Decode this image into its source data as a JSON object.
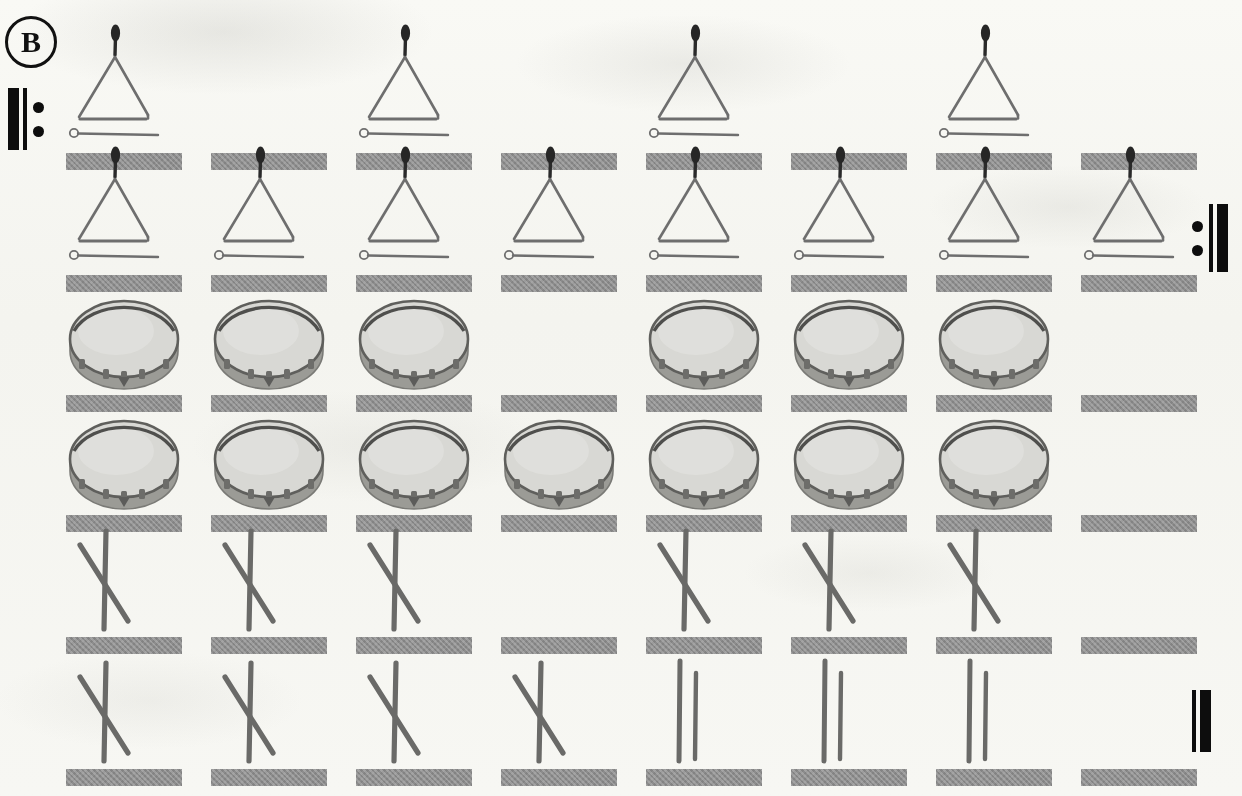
{
  "panel": {
    "label": "B",
    "title": "Percussion rhythm grid"
  },
  "notation": {
    "repeat_start": {
      "name": "repeat-start-sign",
      "glyph": "|:",
      "dots": 2
    },
    "repeat_end": {
      "name": "repeat-end-sign",
      "glyph": ":|",
      "dots": 2
    },
    "final_barline": {
      "name": "final-barline",
      "glyph": "||",
      "dots": 0
    }
  },
  "colors": {
    "beat_bar": "#8d8d8d",
    "ink": "#0d0d0d",
    "paper": "#fbfbf9",
    "instrument_outline": "#6e6e6e",
    "drum_head": "#d8d8d4",
    "drum_rim": "#7a7a76",
    "clave": "#6a6a68"
  },
  "grid": {
    "columns": 8,
    "rows": 6,
    "column_x": [
      66,
      211,
      356,
      501,
      646,
      791,
      936,
      1081
    ],
    "cell_width": 116,
    "row_top": [
      22,
      180,
      300,
      420,
      540,
      662
    ],
    "row_height": [
      148,
      112,
      112,
      112,
      114,
      124
    ],
    "bar_height": 17
  },
  "instruments": {
    "triangle": {
      "name": "triangle",
      "label": "Triangle with beater"
    },
    "drum": {
      "name": "hand-drum",
      "label": "Frame drum"
    },
    "claves_crossed": {
      "name": "claves-crossed",
      "label": "Crossed claves"
    },
    "claves_parallel": {
      "name": "claves-parallel",
      "label": "Parallel claves"
    },
    "rest": {
      "name": "rest",
      "label": "Silent beat"
    }
  },
  "chart_data": {
    "type": "table",
    "xlabel": "Beat",
    "ylabel": "Measure",
    "categories": [
      "1",
      "2",
      "3",
      "4",
      "5",
      "6",
      "7",
      "8"
    ],
    "legend": [
      "triangle",
      "drum",
      "claves_crossed",
      "claves_parallel",
      "rest"
    ],
    "rows": [
      {
        "row": 1,
        "instrument": "triangle",
        "cells": [
          "triangle",
          "rest",
          "triangle",
          "rest",
          "triangle",
          "rest",
          "triangle",
          "rest"
        ],
        "values": [
          1,
          0,
          1,
          0,
          1,
          0,
          1,
          0
        ]
      },
      {
        "row": 2,
        "instrument": "triangle",
        "cells": [
          "triangle",
          "triangle",
          "triangle",
          "triangle",
          "triangle",
          "triangle",
          "triangle",
          "triangle"
        ],
        "values": [
          1,
          1,
          1,
          1,
          1,
          1,
          1,
          1
        ]
      },
      {
        "row": 3,
        "instrument": "drum",
        "cells": [
          "drum",
          "drum",
          "drum",
          "rest",
          "drum",
          "drum",
          "drum",
          "rest"
        ],
        "values": [
          1,
          1,
          1,
          0,
          1,
          1,
          1,
          0
        ]
      },
      {
        "row": 4,
        "instrument": "drum",
        "cells": [
          "drum",
          "drum",
          "drum",
          "drum",
          "drum",
          "drum",
          "drum",
          "rest"
        ],
        "values": [
          1,
          1,
          1,
          1,
          1,
          1,
          1,
          0
        ]
      },
      {
        "row": 5,
        "instrument": "claves",
        "cells": [
          "claves_crossed",
          "claves_crossed",
          "claves_crossed",
          "rest",
          "claves_crossed",
          "claves_crossed",
          "claves_crossed",
          "rest"
        ],
        "values": [
          1,
          1,
          1,
          0,
          1,
          1,
          1,
          0
        ]
      },
      {
        "row": 6,
        "instrument": "claves",
        "cells": [
          "claves_crossed",
          "claves_crossed",
          "claves_crossed",
          "claves_crossed",
          "claves_parallel",
          "claves_parallel",
          "claves_parallel",
          "rest"
        ],
        "values": [
          1,
          1,
          1,
          1,
          1,
          1,
          1,
          0
        ]
      }
    ]
  }
}
